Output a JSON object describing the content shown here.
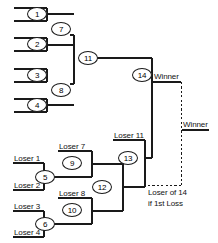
{
  "diagram": {
    "background_color": "#ffffff",
    "line_color": "#1a1a1a"
  },
  "winners_bracket": {
    "seeds": [
      {
        "id": "seed-1",
        "label": "1"
      },
      {
        "id": "seed-2",
        "label": "2"
      },
      {
        "id": "seed-3",
        "label": "3"
      },
      {
        "id": "seed-4",
        "label": "4"
      }
    ],
    "round2": [
      {
        "id": "match-7",
        "label": "7"
      },
      {
        "id": "match-8",
        "label": "8"
      }
    ],
    "round3": [
      {
        "id": "match-11",
        "label": "11"
      }
    ],
    "final": {
      "id": "match-14",
      "label": "14"
    }
  },
  "losers_bracket": {
    "feed_labels": [
      {
        "id": "loser-1",
        "label": "Loser 1"
      },
      {
        "id": "loser-2",
        "label": "Loser 2"
      },
      {
        "id": "loser-3",
        "label": "Loser 3"
      },
      {
        "id": "loser-4",
        "label": "Loser 4"
      },
      {
        "id": "loser-7",
        "label": "Loser 7"
      },
      {
        "id": "loser-8",
        "label": "Loser 8"
      },
      {
        "id": "loser-11",
        "label": "Loser 11"
      }
    ],
    "matches": [
      {
        "id": "match-5",
        "label": "5"
      },
      {
        "id": "match-6",
        "label": "6"
      },
      {
        "id": "match-9",
        "label": "9"
      },
      {
        "id": "match-10",
        "label": "10"
      },
      {
        "id": "match-12",
        "label": "12"
      },
      {
        "id": "match-13",
        "label": "13"
      }
    ]
  },
  "annotations": {
    "winner_primary": "Winner",
    "winner_secondary": "Winner",
    "bracket_reset_line1": "Loser of 14",
    "bracket_reset_line2": "if 1st Loss"
  }
}
